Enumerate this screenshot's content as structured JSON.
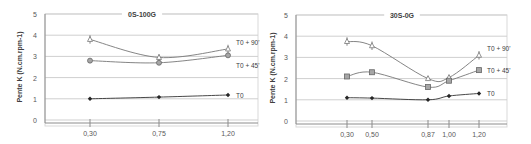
{
  "chart_data": [
    {
      "type": "line",
      "title": "0S-100G",
      "xlabel": "",
      "ylabel": "Pente K (N.cm.rpm-1)",
      "ylim": [
        0,
        5
      ],
      "yticks": [
        "0",
        "1",
        "2",
        "3",
        "4",
        "5"
      ],
      "categories": [
        "0,30",
        "0,75",
        "1,20"
      ],
      "x": [
        0.3,
        0.75,
        1.2
      ],
      "grid": true,
      "legend_position": "inline-right",
      "series": [
        {
          "name": "T0 + 90'",
          "marker": "triangle-open",
          "values": [
            3.8,
            2.95,
            3.35
          ],
          "error": [
            0.2,
            0.15,
            0.2
          ]
        },
        {
          "name": "T0 + 45'",
          "marker": "circle-grey",
          "values": [
            2.8,
            2.7,
            3.05
          ],
          "error": [
            0.1,
            0.1,
            0.1
          ]
        },
        {
          "name": "T0",
          "marker": "diamond-filled",
          "values": [
            1.0,
            1.08,
            1.18
          ],
          "error": [
            0,
            0,
            0
          ]
        }
      ]
    },
    {
      "type": "line",
      "title": "30S-0G",
      "xlabel": "",
      "ylabel": "Pente K (N.cm.rpm-1)",
      "ylim": [
        0,
        5
      ],
      "yticks": [
        "0",
        "1",
        "2",
        "3",
        "4",
        "5"
      ],
      "categories": [
        "0,30",
        "0,50",
        "0,87",
        "1,00",
        "1,20"
      ],
      "x": [
        0.3,
        0.5,
        0.87,
        1.0,
        1.2
      ],
      "grid": true,
      "legend_position": "inline-right",
      "series": [
        {
          "name": "T0 + 90'",
          "marker": "triangle-open",
          "values": [
            3.75,
            3.55,
            2.0,
            2.05,
            3.1
          ],
          "error": [
            0.2,
            0.2,
            0.1,
            0.1,
            0.2
          ]
        },
        {
          "name": "T0 + 45'",
          "marker": "square-grey",
          "values": [
            2.1,
            2.3,
            1.6,
            1.9,
            2.4
          ],
          "error": [
            0.05,
            0.05,
            0.05,
            0.05,
            0.05
          ]
        },
        {
          "name": "T0",
          "marker": "diamond-filled",
          "values": [
            1.1,
            1.08,
            1.0,
            1.18,
            1.3
          ],
          "error": [
            0,
            0,
            0,
            0,
            0
          ]
        }
      ]
    }
  ]
}
